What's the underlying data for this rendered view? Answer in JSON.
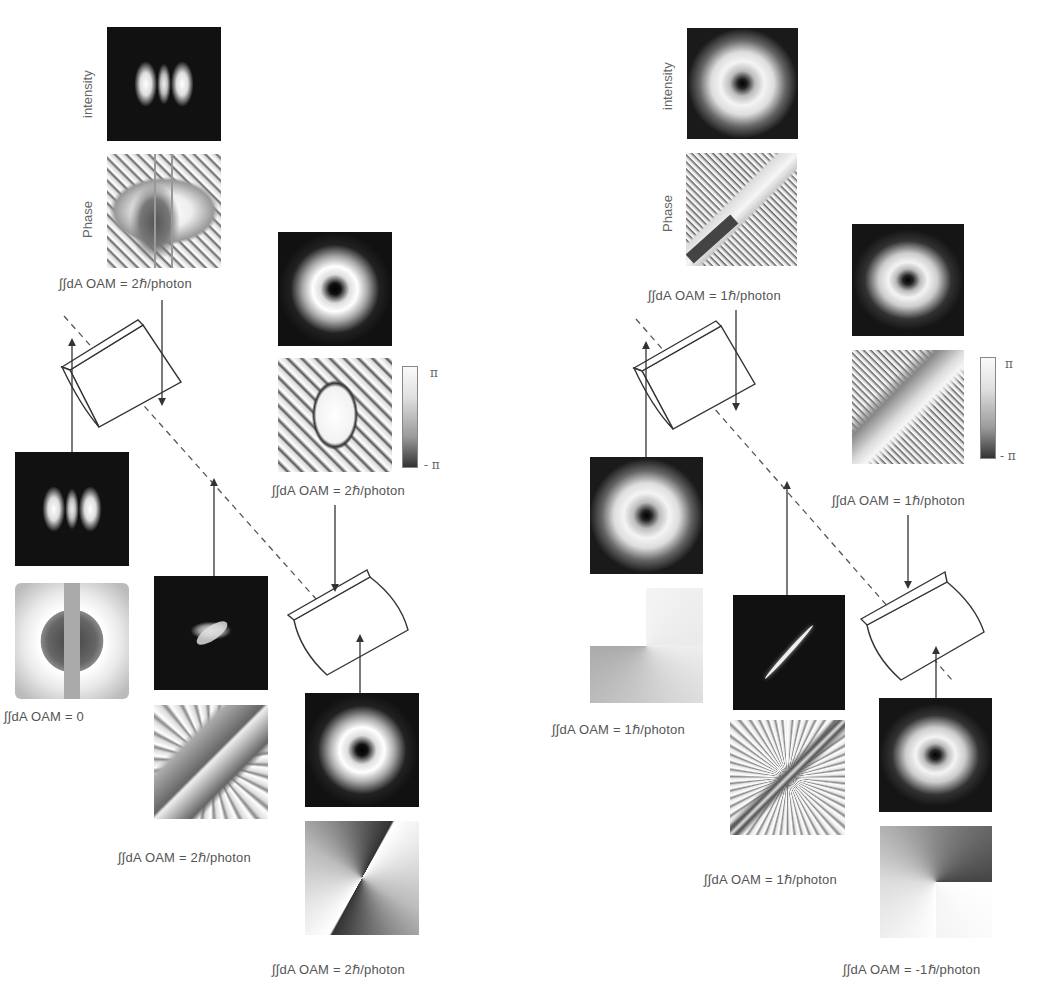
{
  "figure": {
    "left_setup": {
      "row_labels": {
        "intensity": "intensity",
        "phase": "Phase"
      },
      "output_beam": {
        "label": "∫∫dA  OAM = 2ℏ/photon"
      },
      "after_first_lens": {
        "label": "∫∫dA  OAM = 2ℏ/photon",
        "colorbar": {
          "max": "π",
          "min": "- π"
        }
      },
      "input_hg_beam": {
        "label": "∫∫dA  OAM = 0"
      },
      "middle_beam": {
        "label": "∫∫dA  OAM = 2ℏ/photon"
      },
      "lg_input_beam": {
        "label": "∫∫dA  OAM = 2ℏ/photon"
      }
    },
    "right_setup": {
      "row_labels": {
        "intensity": "intensity",
        "phase": "Phase"
      },
      "output_beam": {
        "label": "∫∫dA  OAM = 1ℏ/photon"
      },
      "after_first_lens": {
        "label": "∫∫dA  OAM = 1ℏ/photon",
        "colorbar": {
          "max": "π",
          "min": "- π"
        }
      },
      "input_beam": {
        "label": "∫∫dA  OAM = 1ℏ/photon"
      },
      "middle_beam": {
        "label": "∫∫dA  OAM = 1ℏ/photon"
      },
      "lg_input_beam": {
        "label": "∫∫dA  OAM = -1ℏ/photon"
      }
    }
  }
}
